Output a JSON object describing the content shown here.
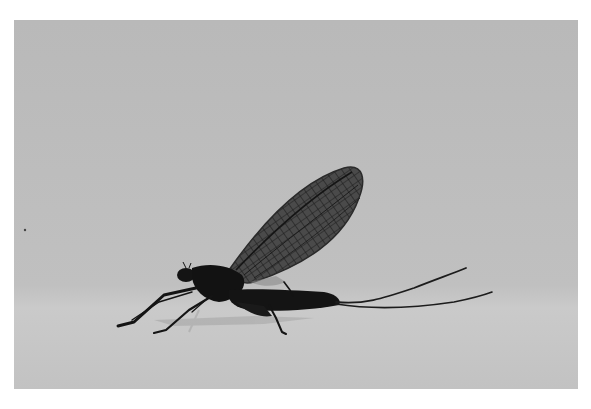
{
  "image": {
    "subject": "Mayfly perched on a surface",
    "alt": "Black-and-white photograph of a mayfly with upright veined wings and long tail filaments, side view, on a pale grey background",
    "colors": {
      "border": "#ffffff",
      "background_upper": "#bcbcbc",
      "background_lower": "#c6c6c6",
      "insect_body": "#161616",
      "wing_fill": "#3a3a3a",
      "wing_veins": "#1a1a1a",
      "shadow": "#a8a8a8"
    }
  }
}
